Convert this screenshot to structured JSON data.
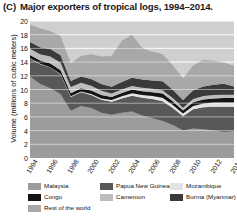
{
  "figure": {
    "panel_letter": "(C)",
    "title": "Major exporters of tropical logs, 1994–2014."
  },
  "chart_data": {
    "type": "area",
    "stacked": true,
    "title": "Major exporters of tropical logs, 1994–2014.",
    "xlabel": "",
    "ylabel": "Volume (millions of cubic meters)",
    "ylim": [
      0,
      20
    ],
    "yticks": [
      0,
      2,
      4,
      6,
      8,
      10,
      12,
      14,
      16,
      18,
      20
    ],
    "xlim": [
      1994,
      2014
    ],
    "xticks": [
      1994,
      1996,
      1998,
      2000,
      2002,
      2004,
      2006,
      2008,
      2010,
      2012,
      2014
    ],
    "x": [
      1994,
      1995,
      1996,
      1997,
      1998,
      1999,
      2000,
      2001,
      2002,
      2003,
      2004,
      2005,
      2006,
      2007,
      2008,
      2009,
      2010,
      2011,
      2012,
      2013,
      2014
    ],
    "grid": true,
    "grid_axis": "y",
    "legend_position": "below",
    "plot_background": "#cfcfcf",
    "grid_color": "#f2f2f2",
    "series": [
      {
        "name": "Malaysia",
        "color": "#9c9c9c",
        "values": [
          11.9,
          10.8,
          10.2,
          9.3,
          6.9,
          7.6,
          7.3,
          6.6,
          6.3,
          6.6,
          6.8,
          6.2,
          5.8,
          5.4,
          4.8,
          4.0,
          4.3,
          4.2,
          4.0,
          3.8,
          3.9
        ]
      },
      {
        "name": "Papua New Guinea",
        "color": "#585858",
        "values": [
          2.6,
          2.9,
          3.0,
          2.9,
          2.0,
          2.0,
          1.9,
          1.9,
          1.9,
          2.1,
          2.3,
          2.6,
          2.8,
          2.9,
          2.5,
          2.1,
          2.8,
          3.2,
          3.5,
          3.7,
          3.6
        ]
      },
      {
        "name": "Mozambique",
        "color": "#e3e3e3",
        "values": [
          0.05,
          0.05,
          0.05,
          0.05,
          0.1,
          0.1,
          0.15,
          0.2,
          0.25,
          0.3,
          0.35,
          0.4,
          0.45,
          0.5,
          0.45,
          0.4,
          0.5,
          0.55,
          0.6,
          0.6,
          0.6
        ]
      },
      {
        "name": "Congo",
        "color": "#141414",
        "values": [
          0.5,
          0.5,
          0.55,
          0.55,
          0.45,
          0.5,
          0.5,
          0.5,
          0.45,
          0.5,
          0.55,
          0.55,
          0.55,
          0.6,
          0.55,
          0.45,
          0.55,
          0.6,
          0.6,
          0.65,
          0.65
        ]
      },
      {
        "name": "Cameroon",
        "color": "#bdbdbd",
        "values": [
          0.9,
          0.9,
          1.0,
          1.1,
          0.9,
          0.8,
          0.7,
          0.6,
          0.5,
          0.5,
          0.5,
          0.5,
          0.5,
          0.5,
          0.45,
          0.4,
          0.45,
          0.5,
          0.5,
          0.5,
          0.5
        ]
      },
      {
        "name": "Burma (Myanmar)",
        "color": "#3a3a3a",
        "values": [
          1.0,
          1.0,
          1.1,
          1.1,
          0.9,
          0.9,
          1.0,
          1.0,
          1.0,
          1.1,
          1.2,
          1.2,
          1.2,
          1.3,
          1.2,
          1.1,
          1.3,
          1.4,
          1.5,
          1.6,
          1.2
        ]
      },
      {
        "name": "Rest of the world",
        "color": "#a8a8a8",
        "values": [
          2.5,
          2.8,
          2.6,
          2.8,
          2.6,
          3.0,
          3.6,
          4.0,
          4.5,
          6.0,
          6.3,
          4.6,
          4.2,
          4.0,
          3.6,
          3.2,
          3.6,
          3.9,
          3.5,
          3.1,
          3.0
        ]
      }
    ]
  },
  "axis": {
    "yticks": [
      "0",
      "2",
      "4",
      "6",
      "8",
      "10",
      "12",
      "14",
      "16",
      "18",
      "20"
    ],
    "xticks": [
      "1994",
      "1996",
      "1998",
      "2000",
      "2002",
      "2004",
      "2006",
      "2008",
      "2010",
      "2012",
      "2014"
    ]
  },
  "legend": {
    "items": [
      {
        "label": "Malaysia",
        "color": "#9c9c9c"
      },
      {
        "label": "Papua New Guinea",
        "color": "#585858"
      },
      {
        "label": "Mozambique",
        "color": "#e3e3e3"
      },
      {
        "label": "Congo",
        "color": "#141414"
      },
      {
        "label": "Cameroon",
        "color": "#bdbdbd"
      },
      {
        "label": "Burma (Myanmar)",
        "color": "#3a3a3a"
      },
      {
        "label": "Rest of the world",
        "color": "#a8a8a8"
      }
    ]
  }
}
